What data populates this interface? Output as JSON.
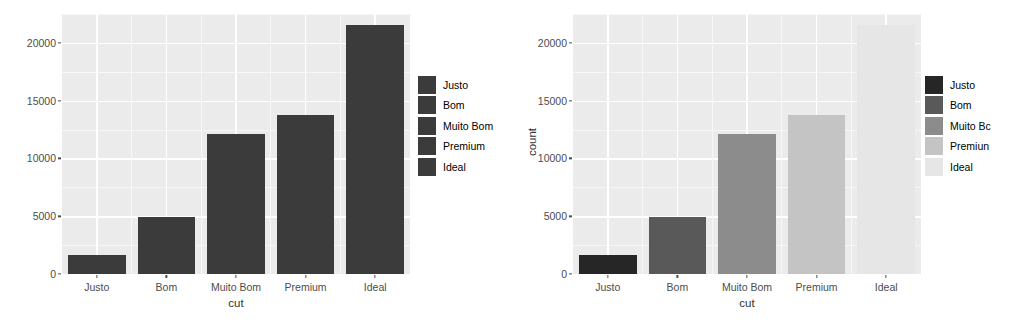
{
  "chart_data": [
    {
      "id": "left",
      "type": "bar",
      "title": "",
      "xlabel": "cut",
      "ylabel": "",
      "categories": [
        "Justo",
        "Bom",
        "Muito Bom",
        "Premium",
        "Ideal"
      ],
      "values": [
        1610,
        4906,
        12082,
        13791,
        21551
      ],
      "ylim": [
        0,
        22500
      ],
      "yticks": [
        0,
        5000,
        10000,
        15000,
        20000
      ],
      "ytick_labels": [
        "0",
        "5000",
        "10000",
        "15000",
        "20000"
      ],
      "grid": true,
      "legend_position": "right",
      "legend_title": "",
      "legend_entries": [
        {
          "label": "Justo",
          "color": "#3b3b3b"
        },
        {
          "label": "Bom",
          "color": "#3b3b3b"
        },
        {
          "label": "Muito Bom",
          "color": "#3b3b3b"
        },
        {
          "label": "Premium",
          "color": "#3b3b3b"
        },
        {
          "label": "Ideal",
          "color": "#3b3b3b"
        }
      ],
      "bar_colors": [
        "#3b3b3b",
        "#3b3b3b",
        "#3b3b3b",
        "#3b3b3b",
        "#3b3b3b"
      ],
      "panel_color": "#ebebeb"
    },
    {
      "id": "right",
      "type": "bar",
      "title": "",
      "xlabel": "cut",
      "ylabel": "count",
      "categories": [
        "Justo",
        "Bom",
        "Muito Bom",
        "Premium",
        "Ideal"
      ],
      "values": [
        1610,
        4906,
        12082,
        13791,
        21551
      ],
      "ylim": [
        0,
        22500
      ],
      "yticks": [
        0,
        5000,
        10000,
        15000,
        20000
      ],
      "ytick_labels": [
        "0",
        "5000",
        "10000",
        "15000",
        "20000"
      ],
      "grid": true,
      "legend_position": "right",
      "legend_title": "",
      "legend_entries": [
        {
          "label": "Justo",
          "color": "#262626"
        },
        {
          "label": "Bom",
          "color": "#595959"
        },
        {
          "label": "Muito Bc",
          "color": "#8c8c8c"
        },
        {
          "label": "Premiun",
          "color": "#c4c4c4"
        },
        {
          "label": "Ideal",
          "color": "#e6e6e6"
        }
      ],
      "bar_colors": [
        "#262626",
        "#595959",
        "#8c8c8c",
        "#c4c4c4",
        "#e6e6e6"
      ],
      "panel_color": "#ebebeb"
    }
  ]
}
